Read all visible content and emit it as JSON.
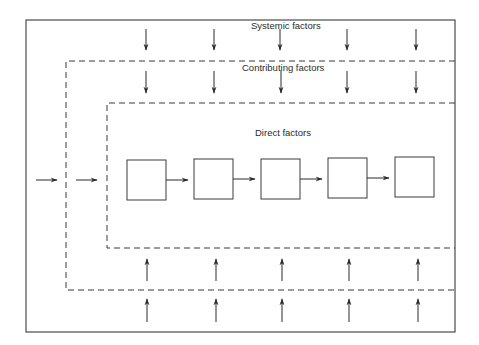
{
  "diagram": {
    "type": "nested-factor-layers",
    "layers": [
      {
        "id": "systemic",
        "label": "Systemic factors",
        "border": "solid"
      },
      {
        "id": "contributing",
        "label": "Contributing factors",
        "border": "dashed"
      },
      {
        "id": "direct",
        "label": "Direct factors",
        "border": "dashed"
      }
    ],
    "process_boxes": 5,
    "down_arrows_per_band": 5,
    "up_arrows_per_band": 5,
    "side_arrows": 2,
    "colors": {
      "line": "#3a3a3a",
      "background": "#ffffff",
      "text": "#2a2a2a"
    }
  }
}
